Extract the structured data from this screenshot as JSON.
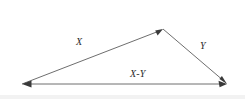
{
  "figure": {
    "background_color": "#ffffff",
    "width": 245,
    "height": 99,
    "line_color": "#6e6e6e",
    "arrow_color": "#3a3a3a",
    "label_color": "#2b2b2b"
  },
  "labels": {
    "x": "X",
    "y": "Y",
    "x_minus_y": "X-Y"
  },
  "vectors": [
    {
      "name": "vector-x",
      "label": "X",
      "from": {
        "x": 22,
        "y": 84
      },
      "to": {
        "x": 163,
        "y": 29
      },
      "arrowhead_at": "to",
      "label_position": {
        "x": 76,
        "y": 37
      }
    },
    {
      "name": "vector-y",
      "label": "Y",
      "from": {
        "x": 163,
        "y": 29
      },
      "to": {
        "x": 227,
        "y": 84
      },
      "arrowhead_at": "to",
      "label_position": {
        "x": 200,
        "y": 41
      }
    },
    {
      "name": "vector-x-minus-y",
      "label": "X-Y",
      "from": {
        "x": 227,
        "y": 84
      },
      "to": {
        "x": 22,
        "y": 84
      },
      "arrowhead_at": "both",
      "label_position": {
        "x": 130,
        "y": 69
      }
    }
  ],
  "vertices": [
    {
      "name": "left-vertex",
      "x": 22,
      "y": 84
    },
    {
      "name": "apex-vertex",
      "x": 163,
      "y": 29
    },
    {
      "name": "right-vertex",
      "x": 227,
      "y": 84
    }
  ]
}
